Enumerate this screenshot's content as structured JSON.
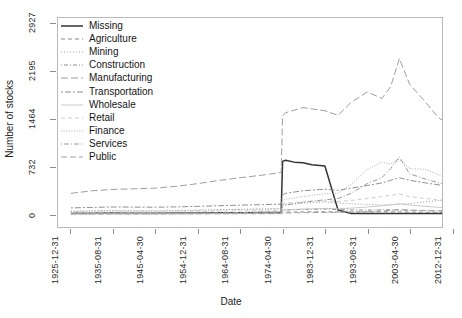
{
  "chart_data": {
    "type": "line",
    "title": "",
    "xlabel": "Date",
    "ylabel": "Number of stocks",
    "grid": false,
    "legend_position": "top-left",
    "ylim": [
      0,
      3000
    ],
    "yticks": [
      0,
      732,
      1464,
      2195,
      2927
    ],
    "xticks": [
      "1925-12-31",
      "1935-08-31",
      "1945-04-30",
      "1954-12-31",
      "1964-08-31",
      "1974-04-30",
      "1983-12-31",
      "1993-08-31",
      "2003-04-30",
      "2012-12-31"
    ],
    "x": [
      "1925-12-31",
      "1930-12-31",
      "1935-08-31",
      "1940-08-31",
      "1945-04-30",
      "1950-04-30",
      "1954-12-31",
      "1959-12-31",
      "1964-08-31",
      "1969-08-31",
      "1973-12-31",
      "1974-04-30",
      "1974-12-31",
      "1976-12-31",
      "1978-12-31",
      "1980-12-31",
      "1983-12-31",
      "1986-12-31",
      "1989-12-31",
      "1993-08-31",
      "1996-12-31",
      "1998-12-31",
      "2000-12-31",
      "2003-04-30",
      "2006-12-31",
      "2009-12-31",
      "2012-12-31"
    ],
    "series": [
      {
        "name": "Missing",
        "linetype": "solid",
        "color": "#333333",
        "values": [
          12,
          14,
          16,
          15,
          14,
          16,
          18,
          20,
          22,
          24,
          26,
          812,
          830,
          800,
          790,
          760,
          742,
          62,
          10,
          8,
          8,
          8,
          8,
          8,
          8,
          8,
          8
        ]
      },
      {
        "name": "Agriculture",
        "linetype": "dashed",
        "color": "#8a8a8a",
        "values": [
          4,
          5,
          6,
          6,
          6,
          7,
          8,
          9,
          10,
          11,
          12,
          28,
          30,
          32,
          34,
          35,
          36,
          34,
          32,
          34,
          36,
          36,
          34,
          30,
          28,
          26,
          24
        ]
      },
      {
        "name": "Mining",
        "linetype": "dotted",
        "color": "#9a9a9a",
        "values": [
          46,
          52,
          54,
          52,
          50,
          56,
          62,
          68,
          74,
          78,
          82,
          140,
          150,
          160,
          170,
          178,
          186,
          170,
          160,
          150,
          140,
          140,
          150,
          160,
          190,
          210,
          230
        ]
      },
      {
        "name": "Construction",
        "linetype": "dotdash",
        "color": "#909090",
        "values": [
          8,
          9,
          10,
          10,
          10,
          12,
          14,
          16,
          18,
          20,
          22,
          60,
          64,
          68,
          72,
          74,
          78,
          70,
          64,
          62,
          66,
          68,
          64,
          58,
          54,
          50,
          46
        ]
      },
      {
        "name": "Manufacturing",
        "linetype": "longdash",
        "color": "#9c9c9c",
        "values": [
          320,
          360,
          380,
          390,
          400,
          430,
          470,
          520,
          560,
          600,
          640,
          1510,
          1560,
          1600,
          1640,
          1620,
          1590,
          1520,
          1720,
          1880,
          1780,
          1960,
          2395,
          2000,
          1720,
          1480,
          1360
        ]
      },
      {
        "name": "Transportation",
        "linetype": "twodash",
        "color": "#8f8f8f",
        "values": [
          96,
          104,
          110,
          108,
          106,
          112,
          120,
          130,
          138,
          146,
          154,
          300,
          320,
          340,
          360,
          370,
          382,
          366,
          400,
          440,
          480,
          520,
          560,
          520,
          480,
          450,
          430
        ]
      },
      {
        "name": "Wholesale",
        "linetype": "solid-light",
        "color": "#c0c0c0",
        "values": [
          4,
          5,
          6,
          6,
          6,
          7,
          8,
          10,
          11,
          12,
          14,
          60,
          66,
          72,
          78,
          82,
          88,
          84,
          92,
          110,
          130,
          145,
          160,
          140,
          120,
          104,
          92
        ]
      },
      {
        "name": "Retail",
        "linetype": "dashed-light",
        "color": "#c4c4c4",
        "values": [
          24,
          28,
          30,
          30,
          30,
          34,
          38,
          44,
          48,
          52,
          56,
          160,
          170,
          180,
          190,
          196,
          204,
          196,
          210,
          240,
          270,
          290,
          310,
          270,
          240,
          216,
          200
        ]
      },
      {
        "name": "Finance",
        "linetype": "dotted-dense",
        "color": "#a6a6a6",
        "values": [
          40,
          46,
          50,
          48,
          46,
          52,
          58,
          66,
          72,
          78,
          84,
          210,
          230,
          250,
          270,
          290,
          310,
          320,
          460,
          690,
          800,
          770,
          845,
          700,
          690,
          600,
          530
        ]
      },
      {
        "name": "Services",
        "linetype": "dotdash-2",
        "color": "#999999",
        "values": [
          10,
          12,
          14,
          14,
          14,
          16,
          18,
          22,
          24,
          26,
          30,
          120,
          140,
          160,
          180,
          200,
          220,
          240,
          320,
          470,
          560,
          700,
          880,
          620,
          540,
          480,
          440
        ]
      },
      {
        "name": "Public",
        "linetype": "longdash-2",
        "color": "#a2a2a2",
        "values": [
          2,
          2,
          3,
          3,
          3,
          4,
          4,
          5,
          6,
          6,
          7,
          16,
          18,
          20,
          22,
          24,
          26,
          26,
          30,
          38,
          48,
          58,
          70,
          62,
          56,
          50,
          46
        ]
      }
    ]
  },
  "axis": {
    "y_title": "Number of stocks",
    "x_title": "Date"
  }
}
